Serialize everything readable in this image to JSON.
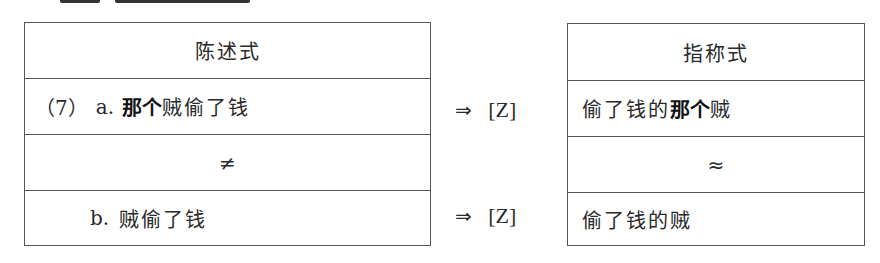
{
  "left_table": {
    "header": "陈述式",
    "row_a": {
      "number": "（7）",
      "label": "a.",
      "bold": "那个",
      "rest": "贼偷了钱"
    },
    "relation": "≠",
    "row_b": {
      "label": "b.",
      "text": "贼偷了钱"
    }
  },
  "arrows": [
    {
      "symbol": "⇒",
      "target": "[Z]"
    },
    {
      "symbol": "⇒",
      "target": "[Z]"
    }
  ],
  "right_table": {
    "header": "指称式",
    "row_a": {
      "prefix": "偷了钱的",
      "bold": "那个",
      "suffix": "贼"
    },
    "relation": "≈",
    "row_b": {
      "text": "偷了钱的贼"
    }
  },
  "colors": {
    "border": "#555555",
    "text": "#2a2a2a"
  }
}
